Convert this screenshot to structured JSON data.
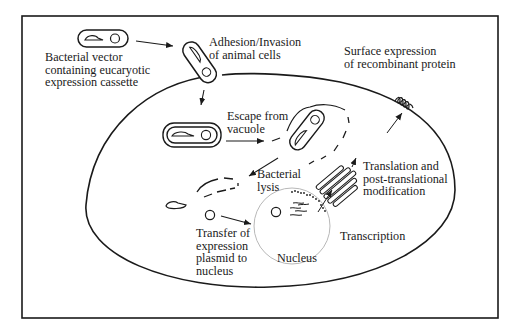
{
  "figure": {
    "type": "schematic diagram",
    "colors": {
      "line": "#1a1a1a",
      "nucleus_outline": "#b8b8b8",
      "background": "#ffffff"
    }
  },
  "labels": {
    "bacterial_vector": [
      "Bacterial vector",
      "containing eucaryotic",
      "expression cassette"
    ],
    "adhesion": [
      "Adhesion/Invasion",
      "of animal cells"
    ],
    "surface_expression": [
      "Surface expression",
      "of recombinant protein"
    ],
    "escape": [
      "Escape from",
      "vacuole"
    ],
    "lysis": [
      "Bacterial",
      "lysis"
    ],
    "translation": [
      "Translation and",
      "post-translational",
      "modification"
    ],
    "transfer": [
      "Transfer of",
      "expression",
      "plasmid to",
      "nucleus"
    ],
    "transcription": "Transcription",
    "nucleus": "Nucleus"
  },
  "steps": [
    "Bacterial vector containing eucaryotic expression cassette",
    "Adhesion/Invasion of animal cells",
    "Escape from vacuole",
    "Bacterial lysis",
    "Transfer of expression plasmid to nucleus",
    "Transcription",
    "Translation and post-translational modification",
    "Surface expression of recombinant protein"
  ]
}
